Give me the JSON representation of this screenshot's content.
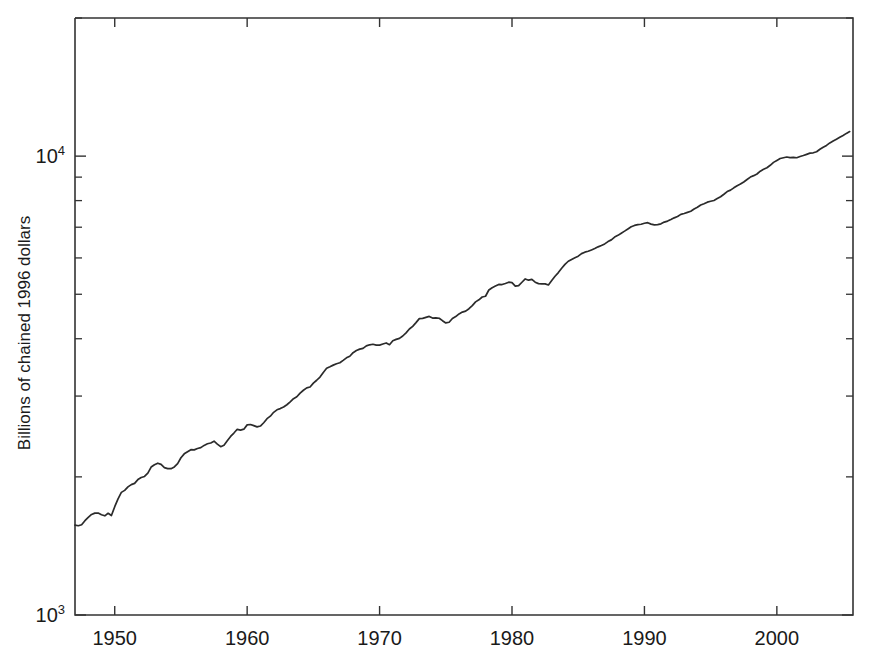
{
  "chart_data": {
    "type": "line",
    "title": "",
    "subtitle": "",
    "xlabel": "",
    "ylabel": "Billions of chained 1996 dollars",
    "yscale": "log",
    "xscale": "linear",
    "grid": false,
    "legend": null,
    "xlim": [
      1947.0,
      2005.75
    ],
    "ylim": [
      1000,
      20000
    ],
    "xticks": [
      1950,
      1960,
      1970,
      1980,
      1990,
      2000
    ],
    "xticklabels": [
      "1950",
      "1960",
      "1970",
      "1980",
      "1990",
      "2000"
    ],
    "yticks": [
      1000,
      10000
    ],
    "yticklabels": [
      "10³",
      "10⁴"
    ],
    "ytick_mantissas": [
      "10",
      "10"
    ],
    "ytick_exponents": [
      "3",
      "4"
    ],
    "y_minor_ticks": [
      2000,
      3000,
      4000,
      5000,
      6000,
      7000,
      8000,
      9000,
      20000
    ],
    "line_color": "#2b2b2b",
    "series": [
      {
        "name": "Real GDP",
        "units": "Billions of chained 1996 dollars",
        "x": [
          1947.0,
          1947.25,
          1947.5,
          1947.75,
          1948.0,
          1948.25,
          1948.5,
          1948.75,
          1949.0,
          1949.25,
          1949.5,
          1949.75,
          1950.0,
          1950.25,
          1950.5,
          1950.75,
          1951.0,
          1951.25,
          1951.5,
          1951.75,
          1952.0,
          1952.25,
          1952.5,
          1952.75,
          1953.0,
          1953.25,
          1953.5,
          1953.75,
          1954.0,
          1954.25,
          1954.5,
          1954.75,
          1955.0,
          1955.25,
          1955.5,
          1955.75,
          1956.0,
          1956.25,
          1956.5,
          1956.75,
          1957.0,
          1957.25,
          1957.5,
          1957.75,
          1958.0,
          1958.25,
          1958.5,
          1958.75,
          1959.0,
          1959.25,
          1959.5,
          1959.75,
          1960.0,
          1960.25,
          1960.5,
          1960.75,
          1961.0,
          1961.25,
          1961.5,
          1961.75,
          1962.0,
          1962.25,
          1962.5,
          1962.75,
          1963.0,
          1963.25,
          1963.5,
          1963.75,
          1964.0,
          1964.25,
          1964.5,
          1964.75,
          1965.0,
          1965.25,
          1965.5,
          1965.75,
          1966.0,
          1966.25,
          1966.5,
          1966.75,
          1967.0,
          1967.25,
          1967.5,
          1967.75,
          1968.0,
          1968.25,
          1968.5,
          1968.75,
          1969.0,
          1969.25,
          1969.5,
          1969.75,
          1970.0,
          1970.25,
          1970.5,
          1970.75,
          1971.0,
          1971.25,
          1971.5,
          1971.75,
          1972.0,
          1972.25,
          1972.5,
          1972.75,
          1973.0,
          1973.25,
          1973.5,
          1973.75,
          1974.0,
          1974.25,
          1974.5,
          1974.75,
          1975.0,
          1975.25,
          1975.5,
          1975.75,
          1976.0,
          1976.25,
          1976.5,
          1976.75,
          1977.0,
          1977.25,
          1977.5,
          1977.75,
          1978.0,
          1978.25,
          1978.5,
          1978.75,
          1979.0,
          1979.25,
          1979.5,
          1979.75,
          1980.0,
          1980.25,
          1980.5,
          1980.75,
          1981.0,
          1981.25,
          1981.5,
          1981.75,
          1982.0,
          1982.25,
          1982.5,
          1982.75,
          1983.0,
          1983.25,
          1983.5,
          1983.75,
          1984.0,
          1984.25,
          1984.5,
          1984.75,
          1985.0,
          1985.25,
          1985.5,
          1985.75,
          1986.0,
          1986.25,
          1986.5,
          1986.75,
          1987.0,
          1987.25,
          1987.5,
          1987.75,
          1988.0,
          1988.25,
          1988.5,
          1988.75,
          1989.0,
          1989.25,
          1989.5,
          1989.75,
          1990.0,
          1990.25,
          1990.5,
          1990.75,
          1991.0,
          1991.25,
          1991.5,
          1991.75,
          1992.0,
          1992.25,
          1992.5,
          1992.75,
          1993.0,
          1993.25,
          1993.5,
          1993.75,
          1994.0,
          1994.25,
          1994.5,
          1994.75,
          1995.0,
          1995.25,
          1995.5,
          1995.75,
          1996.0,
          1996.25,
          1996.5,
          1996.75,
          1997.0,
          1997.25,
          1997.5,
          1997.75,
          1998.0,
          1998.25,
          1998.5,
          1998.75,
          1999.0,
          1999.25,
          1999.5,
          1999.75,
          2000.0,
          2000.25,
          2000.5,
          2000.75,
          2001.0,
          2001.25,
          2001.5,
          2001.75,
          2002.0,
          2002.25,
          2002.5,
          2002.75,
          2003.0,
          2003.25,
          2003.5,
          2003.75,
          2004.0,
          2004.25,
          2004.5,
          2004.75,
          2005.0,
          2005.25,
          2005.5
        ],
        "y": [
          1570,
          1565,
          1573,
          1605,
          1632,
          1656,
          1667,
          1668,
          1654,
          1645,
          1666,
          1647,
          1722,
          1791,
          1850,
          1869,
          1902,
          1924,
          1936,
          1973,
          1994,
          2004,
          2037,
          2101,
          2125,
          2142,
          2129,
          2095,
          2084,
          2084,
          2102,
          2138,
          2201,
          2245,
          2269,
          2292,
          2290,
          2306,
          2316,
          2342,
          2361,
          2371,
          2392,
          2358,
          2327,
          2344,
          2397,
          2450,
          2492,
          2539,
          2529,
          2541,
          2596,
          2601,
          2586,
          2570,
          2581,
          2624,
          2678,
          2712,
          2765,
          2800,
          2817,
          2840,
          2872,
          2914,
          2960,
          2989,
          3045,
          3089,
          3126,
          3139,
          3201,
          3248,
          3300,
          3378,
          3449,
          3475,
          3504,
          3529,
          3545,
          3588,
          3634,
          3664,
          3730,
          3770,
          3797,
          3812,
          3859,
          3880,
          3891,
          3873,
          3874,
          3896,
          3916,
          3882,
          3960,
          3987,
          4008,
          4055,
          4120,
          4200,
          4257,
          4337,
          4425,
          4429,
          4452,
          4474,
          4437,
          4443,
          4433,
          4379,
          4330,
          4344,
          4427,
          4470,
          4531,
          4572,
          4593,
          4650,
          4724,
          4813,
          4863,
          4932,
          4950,
          5108,
          5166,
          5209,
          5254,
          5250,
          5279,
          5312,
          5302,
          5210,
          5220,
          5311,
          5399,
          5366,
          5389,
          5313,
          5274,
          5266,
          5268,
          5238,
          5356,
          5474,
          5575,
          5698,
          5810,
          5901,
          5956,
          6008,
          6054,
          6131,
          6176,
          6203,
          6246,
          6291,
          6343,
          6388,
          6437,
          6513,
          6569,
          6664,
          6720,
          6793,
          6863,
          6938,
          7017,
          7062,
          7090,
          7104,
          7140,
          7160,
          7110,
          7081,
          7089,
          7120,
          7183,
          7218,
          7274,
          7337,
          7386,
          7467,
          7500,
          7540,
          7582,
          7667,
          7735,
          7824,
          7876,
          7937,
          7972,
          8006,
          8084,
          8158,
          8259,
          8371,
          8432,
          8529,
          8620,
          8693,
          8785,
          8894,
          9002,
          9067,
          9142,
          9274,
          9367,
          9435,
          9550,
          9691,
          9786,
          9883,
          9921,
          9957,
          9925,
          9942,
          9918,
          9981,
          10031,
          10090,
          10151,
          10168,
          10221,
          10351,
          10457,
          10554,
          10686,
          10787,
          10888,
          10994,
          11095,
          11209,
          11311
        ]
      }
    ],
    "notes": {
      "start_value": 1570,
      "end_value": 11311,
      "start_year": 1947,
      "end_year": 2005
    }
  },
  "axes": {
    "y_axis_label": "Billions of chained 1996 dollars",
    "x_tick_labels": [
      "1950",
      "1960",
      "1970",
      "1980",
      "1990",
      "2000"
    ],
    "y_tick_label_low_base": "10",
    "y_tick_label_low_exp": "3",
    "y_tick_label_high_base": "10",
    "y_tick_label_high_exp": "4"
  }
}
